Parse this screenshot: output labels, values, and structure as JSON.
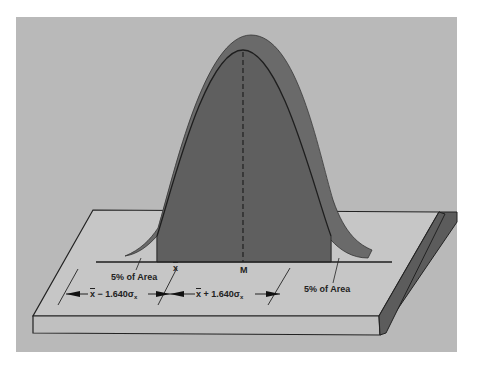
{
  "diagram": {
    "colors": {
      "page_background": "#ffffff",
      "panel_background": "#b9b9b9",
      "slab_top": "#c6c6c6",
      "slab_front": "#c0c0c0",
      "slab_side": "#5c5c5c",
      "curve_fill": "#5f5f5f",
      "curve_back": "#6a6a6a",
      "outline": "#222222"
    },
    "labels": {
      "left_tail": "5% of Area",
      "right_tail": "5% of Area",
      "sample_mean": "x",
      "population_mean": "M",
      "lower_bound_prefix": "x",
      "lower_bound_op": " − 1.640σ",
      "lower_bound_sub": "x",
      "upper_bound_prefix": "x",
      "upper_bound_op": " + 1.640σ",
      "upper_bound_sub": "x"
    },
    "critical_value": 1.64,
    "tail_area_percent": 5
  }
}
